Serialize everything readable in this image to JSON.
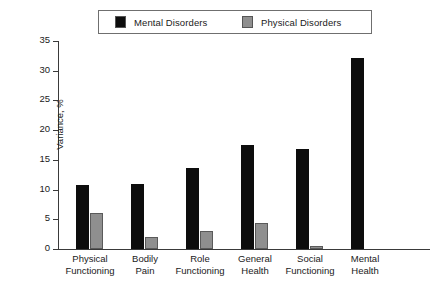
{
  "chart_data": {
    "type": "bar",
    "title": "",
    "xlabel": "",
    "ylabel": "Variance, %",
    "ylim": [
      0,
      35
    ],
    "yticks": [
      0,
      5,
      10,
      15,
      20,
      25,
      30,
      35
    ],
    "grid": false,
    "legend_position": "top",
    "categories": [
      "Physical Functioning",
      "Bodily Pain",
      "Role Functioning",
      "General Health",
      "Social Functioning",
      "Mental Health"
    ],
    "category_lines": [
      [
        "Physical",
        "Functioning"
      ],
      [
        "Bodily",
        "Pain"
      ],
      [
        "Role",
        "Functioning"
      ],
      [
        "General",
        "Health"
      ],
      [
        "Social",
        "Functioning"
      ],
      [
        "Mental",
        "Health"
      ]
    ],
    "series": [
      {
        "name": "Mental Disorders",
        "color": "#0d0d0d",
        "values": [
          10.7,
          11.0,
          13.7,
          17.5,
          16.8,
          32.2
        ]
      },
      {
        "name": "Physical Disorders",
        "color": "#8f8f8f",
        "values": [
          6.0,
          2.0,
          3.0,
          4.3,
          0.5,
          0.0
        ]
      }
    ]
  },
  "legend": {
    "entries": [
      {
        "label": "Mental Disorders",
        "color": "#0d0d0d"
      },
      {
        "label": "Physical Disorders",
        "color": "#8f8f8f"
      }
    ]
  },
  "axes": {
    "y_title": "Variance, %",
    "y_tick_labels": [
      "35",
      "30",
      "25",
      "20",
      "15",
      "10",
      "5",
      "0"
    ]
  }
}
